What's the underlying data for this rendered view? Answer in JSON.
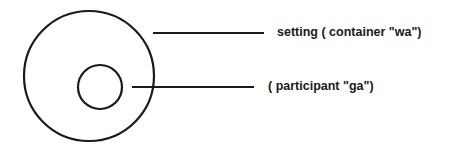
{
  "diagram": {
    "title": "",
    "stroke_color": "#1a1a1a",
    "background": "#ffffff",
    "shapes": [
      {
        "id": "outer-circle",
        "type": "circle",
        "role": "setting",
        "cx": 89,
        "cy": 76,
        "r": 65
      },
      {
        "id": "inner-circle",
        "type": "circle",
        "role": "participant",
        "cx": 100,
        "cy": 87,
        "r": 22
      }
    ],
    "leaders": [
      {
        "id": "setting-leader",
        "x1": 153,
        "y1": 33,
        "x2": 264,
        "y2": 33
      },
      {
        "id": "participant-leader",
        "x1": 132,
        "y1": 87,
        "x2": 254,
        "y2": 87
      }
    ],
    "labels": {
      "setting": "setting ( container \"wa\")",
      "participant": "( participant \"ga\")"
    }
  }
}
